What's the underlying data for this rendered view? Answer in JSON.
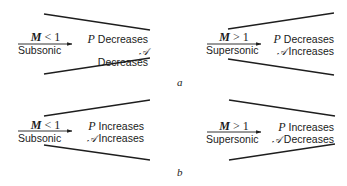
{
  "colors": {
    "line": "#1e1e1e",
    "text": "#1a1a1a",
    "background": "#ffffff"
  },
  "panels": [
    {
      "label": "a",
      "cases": [
        {
          "duct": "converging",
          "mach_symbol": "M",
          "mach_relation": "< 1",
          "regime": "Subsonic",
          "effects": [
            {
              "variable": "P",
              "change": "Decreases"
            },
            {
              "variable": "𝒜",
              "change": "Decreases"
            }
          ]
        },
        {
          "duct": "diverging",
          "mach_symbol": "M",
          "mach_relation": "> 1",
          "regime": "Supersonic",
          "effects": [
            {
              "variable": "P",
              "change": "Decreases"
            },
            {
              "variable": "𝒜",
              "change": "Increases"
            }
          ]
        }
      ]
    },
    {
      "label": "b",
      "cases": [
        {
          "duct": "diverging",
          "mach_symbol": "M",
          "mach_relation": "< 1",
          "regime": "Subsonic",
          "effects": [
            {
              "variable": "P",
              "change": "Increases"
            },
            {
              "variable": "𝒜",
              "change": "Increases"
            }
          ]
        },
        {
          "duct": "converging",
          "mach_symbol": "M",
          "mach_relation": "> 1",
          "regime": "Supersonic",
          "effects": [
            {
              "variable": "P",
              "change": "Increases"
            },
            {
              "variable": "𝒜",
              "change": "Decreases"
            }
          ]
        }
      ]
    }
  ]
}
